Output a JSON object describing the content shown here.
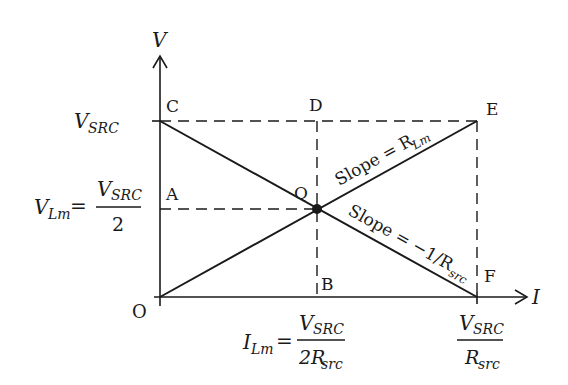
{
  "diagram": {
    "axes": {
      "y_label": "V",
      "x_label": "I",
      "origin_label": "O"
    },
    "points": {
      "C": "C",
      "D": "D",
      "E": "E",
      "A": "A",
      "B": "B",
      "F": "F",
      "Q": "Q"
    },
    "y_ticks": {
      "vsrc": {
        "main": "V",
        "sub": "SRC"
      },
      "vlm": {
        "lhs_main": "V",
        "lhs_sub": "Lm",
        "eq": "=",
        "num_main": "V",
        "num_sub": "SRC",
        "den": "2"
      }
    },
    "x_ticks": {
      "ilm": {
        "lhs_main": "I",
        "lhs_sub": "Lm",
        "eq": "=",
        "num_main": "V",
        "num_sub": "SRC",
        "den_main": "2R",
        "den_sub": "src"
      },
      "isc": {
        "num_main": "V",
        "num_sub": "SRC",
        "den_main": "R",
        "den_sub": "src"
      }
    },
    "line_labels": {
      "load": {
        "text": "Slope = R",
        "sub": "Lm"
      },
      "source": {
        "text": "Slope = −1/R",
        "sub": "src"
      }
    },
    "colors": {
      "stroke": "#1a1a1a",
      "background": "#ffffff"
    }
  }
}
